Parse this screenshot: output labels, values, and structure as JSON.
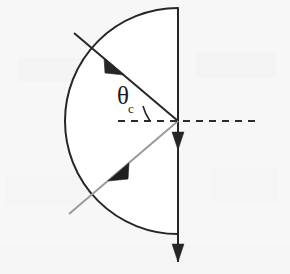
{
  "figure": {
    "background_color": "#f7f7f7",
    "width": 290,
    "height": 274,
    "labels": {
      "critical_angle_symbol": "θ",
      "critical_angle_subscript": "c"
    },
    "colors": {
      "stroke_dark": "#262626",
      "stroke_light": "#9a9a9a",
      "normal_dashed": "#2b2b2b",
      "background": "#f7f7f7"
    },
    "elements": [
      {
        "name": "semicircle-boundary",
        "type": "arc",
        "description": "Curved boundary of semicircular medium, flat face on the right",
        "center": [
          178,
          121
        ],
        "radius": 113,
        "start_point": [
          178,
          8
        ],
        "end_point": [
          178,
          234
        ],
        "color": "#262626",
        "stroke_width": 2
      },
      {
        "name": "flat-face-line",
        "type": "line",
        "description": "Vertical flat face of the semicircle with downward arrowheads",
        "from": [
          178,
          8
        ],
        "to": [
          178,
          262
        ],
        "color": "#262626",
        "stroke_width": 2,
        "arrowheads": [
          {
            "name": "flat-face-arrow-upper",
            "at": [
              178,
              146
            ],
            "direction": "down"
          },
          {
            "name": "flat-face-arrow-lower",
            "at": [
              178,
              258
            ],
            "direction": "down"
          }
        ]
      },
      {
        "name": "incident-ray",
        "type": "ray",
        "description": "Incoming ray from upper left striking the centre of the flat face",
        "from": [
          74,
          33
        ],
        "to": [
          178,
          121
        ],
        "color": "#262626",
        "stroke_width": 2,
        "arrowhead": {
          "name": "incident-ray-arrow",
          "at": [
            113,
            66
          ],
          "direction": "down-right"
        }
      },
      {
        "name": "refracted-ray",
        "type": "ray",
        "description": "Lighter ray leaving the centre toward the lower left",
        "from": [
          178,
          121
        ],
        "to": [
          69,
          214
        ],
        "color": "#9a9a9a",
        "stroke_width": 2,
        "arrowhead": {
          "name": "refracted-ray-arrow",
          "at": [
            118,
            172
          ],
          "direction": "down-left"
        }
      },
      {
        "name": "normal-dashed-line",
        "type": "dashed-line",
        "description": "Horizontal normal / reference line through the centre point",
        "from": [
          118,
          121
        ],
        "to": [
          258,
          121
        ],
        "color": "#2b2b2b",
        "stroke_width": 2,
        "dash_pattern": "7 6"
      },
      {
        "name": "angle-arc",
        "type": "arc",
        "description": "Small arc marking the critical angle between incident ray and normal",
        "center": [
          178,
          121
        ],
        "radius": 46,
        "color": "#262626",
        "stroke_width": 1.6
      },
      {
        "name": "critical-angle-label",
        "type": "text",
        "description": "Theta sub c label for the critical angle",
        "position": [
          117,
          83
        ]
      }
    ]
  }
}
